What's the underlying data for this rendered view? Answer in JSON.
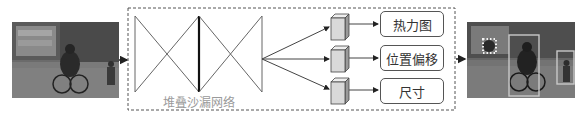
{
  "network": {
    "caption": "堆叠沙漏网络"
  },
  "outputs": [
    {
      "label": "热力图"
    },
    {
      "label": "位置偏移"
    },
    {
      "label": "尺寸"
    }
  ],
  "input_image": {
    "description": "grayscale street photo with cyclists"
  },
  "output_image": {
    "description": "same photo with detected bounding boxes and heatmap dots"
  },
  "colors": {
    "line": "#444444",
    "dashed_border": "#555555",
    "box_white": "#ffffff",
    "caption": "#9a9a9a"
  }
}
